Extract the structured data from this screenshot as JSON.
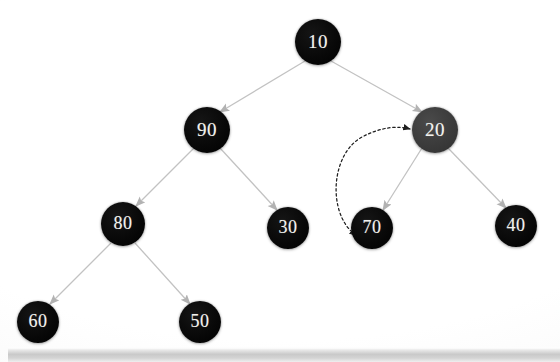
{
  "diagram": {
    "background_color": "#ffffff",
    "node_fill_default": "#080808",
    "node_fill_highlight": "#3b3b3b",
    "node_text_color": "#f2f2ee",
    "edge_color": "#bdbdbd",
    "arrow_color": "#b0b0b0",
    "dashed_arrow_color": "#2a2a2a"
  },
  "nodes": [
    {
      "id": "n10",
      "label": "10",
      "x": 318,
      "y": 42,
      "r": 23,
      "font_size": 19,
      "highlight": false
    },
    {
      "id": "n90",
      "label": "90",
      "x": 207,
      "y": 130,
      "r": 23,
      "font_size": 19,
      "highlight": false
    },
    {
      "id": "n20",
      "label": "20",
      "x": 435,
      "y": 130,
      "r": 23,
      "font_size": 19,
      "highlight": true
    },
    {
      "id": "n80",
      "label": "80",
      "x": 123,
      "y": 224,
      "r": 22,
      "font_size": 18,
      "highlight": false
    },
    {
      "id": "n30",
      "label": "30",
      "x": 288,
      "y": 228,
      "r": 21,
      "font_size": 18,
      "highlight": false
    },
    {
      "id": "n70",
      "label": "70",
      "x": 372,
      "y": 228,
      "r": 21,
      "font_size": 18,
      "highlight": false
    },
    {
      "id": "n40",
      "label": "40",
      "x": 516,
      "y": 226,
      "r": 21,
      "font_size": 18,
      "highlight": false
    },
    {
      "id": "n60",
      "label": "60",
      "x": 38,
      "y": 322,
      "r": 21,
      "font_size": 18,
      "highlight": false
    },
    {
      "id": "n50",
      "label": "50",
      "x": 200,
      "y": 322,
      "r": 21,
      "font_size": 18,
      "highlight": false
    }
  ],
  "edges": [
    {
      "id": "e10-90",
      "from": "n10",
      "to": "n90",
      "style": "solid",
      "arrow": "end"
    },
    {
      "id": "e10-20",
      "from": "n10",
      "to": "n20",
      "style": "solid",
      "arrow": "end"
    },
    {
      "id": "e90-80",
      "from": "n90",
      "to": "n80",
      "style": "solid",
      "arrow": "end"
    },
    {
      "id": "e90-30",
      "from": "n90",
      "to": "n30",
      "style": "solid",
      "arrow": "end"
    },
    {
      "id": "e20-70",
      "from": "n20",
      "to": "n70",
      "style": "solid",
      "arrow": "end"
    },
    {
      "id": "e20-40",
      "from": "n20",
      "to": "n40",
      "style": "solid",
      "arrow": "end"
    },
    {
      "id": "e80-60",
      "from": "n80",
      "to": "n60",
      "style": "solid",
      "arrow": "end"
    },
    {
      "id": "e80-50",
      "from": "n80",
      "to": "n50",
      "style": "solid",
      "arrow": "end"
    }
  ],
  "annotation_arrow": {
    "id": "swap-20-70",
    "style": "dashed",
    "arrow": "both",
    "from": "n70",
    "to": "n20",
    "path": "M 352 232 C 330 212, 332 155, 362 137 C 383 125, 398 126, 410 129"
  },
  "bottom_bar": {
    "present": true,
    "kind": "horizontal-scrollbar"
  }
}
